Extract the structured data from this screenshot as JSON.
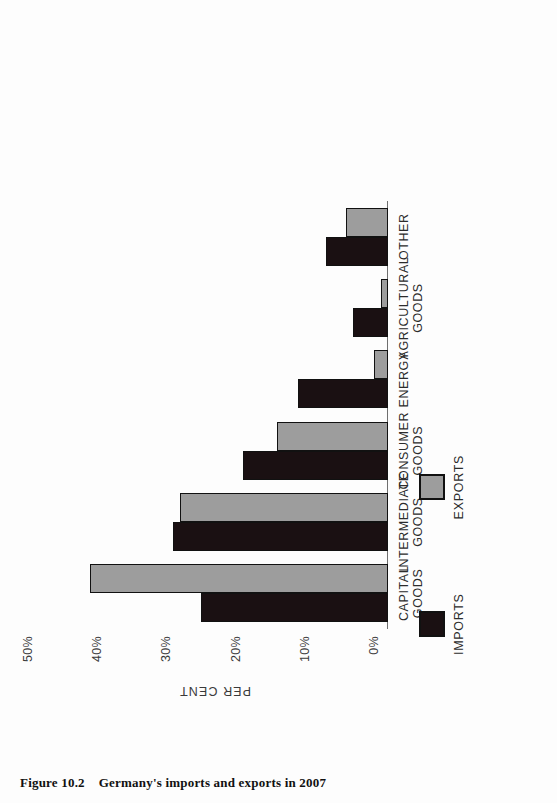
{
  "caption": {
    "number": "Figure 10.2",
    "text": "Germany's imports and exports in 2007"
  },
  "legend": {
    "position": "below-left",
    "items": [
      {
        "label": "IMPORTS",
        "color": "#1a1012",
        "swatch": "filled-square-black"
      },
      {
        "label": "EXPORTS",
        "color": "#9d9d9d",
        "swatch": "filled-square-grey"
      }
    ]
  },
  "chart_data": {
    "type": "bar",
    "title": "Germany's imports and exports in 2007",
    "xlabel": "",
    "ylabel": "PER CENT",
    "ylim": [
      0,
      50
    ],
    "yticks": [
      "0%",
      "10%",
      "20%",
      "30%",
      "40%",
      "50%"
    ],
    "grid": false,
    "legend_position": "below-left",
    "orientation": "vertical-bars-rotated-page",
    "categories": [
      "CAPITAL\nGOODS",
      "INTERMEDIATE\nGOODS",
      "CONSUMER\nGOODS",
      "ENERGY",
      "AGRICULTURAL\nGOODS",
      "OTHER"
    ],
    "series": [
      {
        "name": "IMPORTS",
        "color": "#1a1012",
        "values": [
          27,
          31,
          21,
          13,
          5,
          9
        ]
      },
      {
        "name": "EXPORTS",
        "color": "#9d9d9d",
        "values": [
          43,
          30,
          16,
          2,
          1,
          6
        ]
      }
    ]
  },
  "colors": {
    "imports": "#1a1012",
    "exports": "#9d9d9d",
    "axis": "#6f6f6f",
    "text": "#2c2c2c",
    "page": "#fdfdfd"
  }
}
